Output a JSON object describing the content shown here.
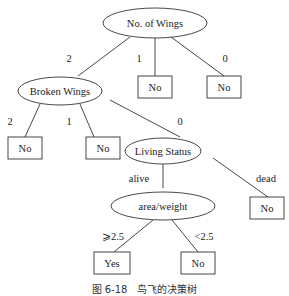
{
  "diagram": {
    "type": "decision-tree",
    "nodes": {
      "root": "No. of Wings",
      "broken": "Broken Wings",
      "living": "Living Status",
      "area": "area/weight",
      "leaf_w1": "No",
      "leaf_w0": "No",
      "leaf_b2": "No",
      "leaf_b1": "No",
      "leaf_dead": "No",
      "leaf_ge": "Yes",
      "leaf_lt": "No"
    },
    "edges": {
      "w2": "2",
      "w1": "1",
      "w0": "0",
      "b2": "2",
      "b1": "1",
      "b0": "0",
      "alive": "alive",
      "dead": "dead",
      "ge": "⩾2.5",
      "lt": "<2.5"
    }
  },
  "caption": "图 6-18　鸟飞的决策树"
}
